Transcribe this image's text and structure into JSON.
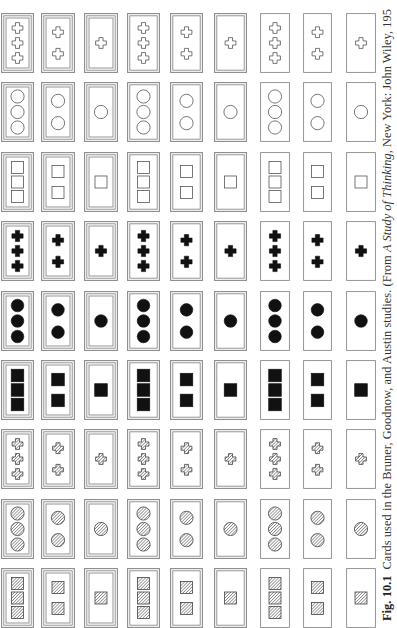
{
  "figure": {
    "caption": {
      "label": "Fig. 10.1",
      "text_before_title": "Cards used in the Bruner, Goodnow, and Austin studies. (From ",
      "book_title": "A Study of Thinking,",
      "text_after_title": " New York: John Wiley, 195"
    },
    "rows": [
      {
        "shape": "cross",
        "fill": "open"
      },
      {
        "shape": "circle",
        "fill": "open"
      },
      {
        "shape": "square",
        "fill": "open"
      },
      {
        "shape": "cross",
        "fill": "solid"
      },
      {
        "shape": "circle",
        "fill": "solid"
      },
      {
        "shape": "square",
        "fill": "solid"
      },
      {
        "shape": "cross",
        "fill": "hatched"
      },
      {
        "shape": "circle",
        "fill": "hatched"
      },
      {
        "shape": "square",
        "fill": "hatched"
      }
    ],
    "columns": [
      {
        "borders": 3,
        "count": 3
      },
      {
        "borders": 3,
        "count": 2
      },
      {
        "borders": 3,
        "count": 1
      },
      {
        "borders": 2,
        "count": 3
      },
      {
        "borders": 2,
        "count": 2
      },
      {
        "borders": 2,
        "count": 1
      },
      {
        "borders": 1,
        "count": 3
      },
      {
        "borders": 1,
        "count": 2
      },
      {
        "borders": 1,
        "count": 1
      }
    ],
    "colors": {
      "ink": "#111111",
      "outline": "#555555",
      "border": "#8a8a8a",
      "paper": "#ffffff"
    }
  }
}
